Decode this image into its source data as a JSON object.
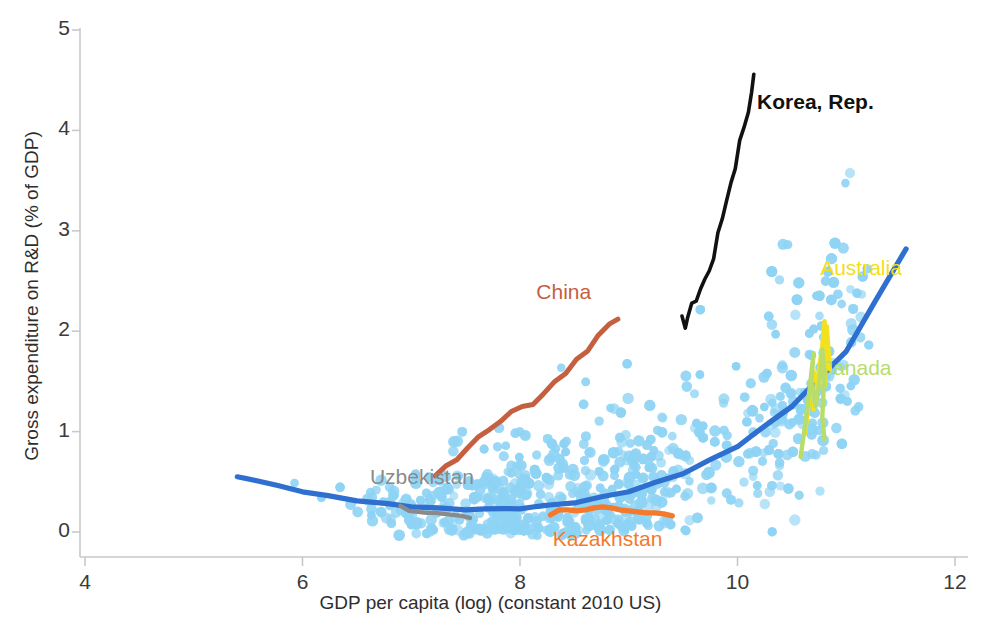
{
  "chart_data": {
    "type": "scatter",
    "title": "",
    "xlabel": "GDP per capita (log) (constant 2010 US)",
    "ylabel": "Gross expenditure on R&D (% of GDP)",
    "xlim": [
      3.6,
      12.3
    ],
    "ylim": [
      -0.25,
      5.0
    ],
    "xticks": [
      4,
      6,
      8,
      10,
      12
    ],
    "xtick_labels": [
      "4",
      "6",
      "8",
      "10",
      "12"
    ],
    "yticks": [
      0,
      1,
      2,
      3,
      4,
      5
    ],
    "ytick_labels": [
      "0",
      "1",
      "2",
      "3",
      "4",
      "5"
    ],
    "grid": false,
    "legend": "inline-annotations",
    "scatter": {
      "name": "All countries (pooled years)",
      "color": "#8ed3f4",
      "marker": "circle",
      "point_count": 1100,
      "description": "Pooled country-year observations of R&D intensity vs log GDP per capita; density increases with GDP, spread widens above log GDP 10."
    },
    "trend": {
      "name": "Quadratic fit",
      "color": "#2f6fd0",
      "x": [
        5.4,
        6.0,
        6.5,
        7.0,
        7.5,
        8.0,
        8.5,
        9.0,
        9.5,
        10.0,
        10.5,
        11.0,
        11.55
      ],
      "y": [
        0.55,
        0.4,
        0.31,
        0.25,
        0.22,
        0.23,
        0.29,
        0.4,
        0.58,
        0.85,
        1.25,
        1.8,
        2.82
      ]
    },
    "series": [
      {
        "name": "Korea, Rep.",
        "color": "#111111",
        "label_color": "#111111",
        "label_x": 10.18,
        "label_y": 4.25,
        "x": [
          9.49,
          9.52,
          9.54,
          9.58,
          9.62,
          9.66,
          9.7,
          9.74,
          9.78,
          9.82,
          9.86,
          9.9,
          9.94,
          9.98,
          10.02,
          10.06,
          10.1,
          10.13,
          10.15
        ],
        "y": [
          2.15,
          2.03,
          2.13,
          2.28,
          2.3,
          2.42,
          2.52,
          2.6,
          2.72,
          2.98,
          3.12,
          3.3,
          3.48,
          3.62,
          3.9,
          4.03,
          4.18,
          4.38,
          4.56
        ]
      },
      {
        "name": "China",
        "color": "#c4603f",
        "label_color": "#c4603f",
        "label_x": 8.15,
        "label_y": 2.36,
        "x": [
          7.22,
          7.32,
          7.42,
          7.52,
          7.62,
          7.72,
          7.82,
          7.92,
          8.02,
          8.12,
          8.22,
          8.32,
          8.42,
          8.52,
          8.62,
          8.72,
          8.82,
          8.9
        ],
        "y": [
          0.56,
          0.66,
          0.72,
          0.84,
          0.95,
          1.02,
          1.1,
          1.2,
          1.25,
          1.27,
          1.38,
          1.5,
          1.58,
          1.72,
          1.8,
          1.96,
          2.07,
          2.12
        ]
      },
      {
        "name": "Australia",
        "color": "#f3e11e",
        "label_color": "#f1df1a",
        "label_x": 10.76,
        "label_y": 2.6,
        "x": [
          10.62,
          10.66,
          10.7,
          10.73,
          10.7,
          10.74,
          10.78,
          10.8,
          10.82,
          10.8,
          10.78,
          10.82,
          10.85
        ],
        "y": [
          0.98,
          1.3,
          1.6,
          1.48,
          1.22,
          1.55,
          1.85,
          2.1,
          1.8,
          1.45,
          1.7,
          2.05,
          1.62
        ]
      },
      {
        "name": "Canada",
        "color": "#b8dd6a",
        "label_color": "#b8dd6a",
        "label_x": 10.74,
        "label_y": 1.6,
        "x": [
          10.58,
          10.62,
          10.66,
          10.7,
          10.68,
          10.72,
          10.76,
          10.78,
          10.8,
          10.78,
          10.8
        ],
        "y": [
          0.75,
          1.05,
          1.4,
          1.78,
          1.52,
          1.25,
          1.55,
          1.82,
          1.6,
          1.15,
          0.92
        ]
      },
      {
        "name": "Uzbekistan",
        "color": "#8a8a8a",
        "label_color": "#8a8a8a",
        "label_x": 6.62,
        "label_y": 0.52,
        "x": [
          6.9,
          6.98,
          7.06,
          7.14,
          7.22,
          7.3,
          7.38,
          7.46,
          7.54
        ],
        "y": [
          0.26,
          0.21,
          0.2,
          0.19,
          0.19,
          0.18,
          0.17,
          0.16,
          0.14
        ]
      },
      {
        "name": "Kazakhstan",
        "color": "#f4792a",
        "label_color": "#f4792a",
        "label_x": 8.3,
        "label_y": -0.1,
        "x": [
          8.28,
          8.36,
          8.44,
          8.52,
          8.6,
          8.68,
          8.76,
          8.84,
          8.92,
          9.0,
          9.08,
          9.16,
          9.24,
          9.32,
          9.4
        ],
        "y": [
          0.17,
          0.22,
          0.22,
          0.21,
          0.22,
          0.24,
          0.25,
          0.24,
          0.22,
          0.21,
          0.2,
          0.19,
          0.19,
          0.18,
          0.16
        ]
      }
    ]
  },
  "axes": {
    "x_title": "GDP per capita (log) (constant 2010 US)",
    "y_title": "Gross expenditure on R&D (% of GDP)",
    "x_tick_labels": [
      "4",
      "6",
      "8",
      "10",
      "12"
    ],
    "y_tick_labels": [
      "0",
      "1",
      "2",
      "3",
      "4",
      "5"
    ]
  },
  "labels": {
    "korea": "Korea, Rep.",
    "china": "China",
    "australia": "Australia",
    "canada": "Canada",
    "uzbekistan": "Uzbekistan",
    "kazakhstan": "Kazakhstan"
  },
  "colors": {
    "scatter": "#8ed3f4",
    "trend": "#2f6fd0",
    "korea": "#111111",
    "china": "#c4603f",
    "australia": "#f1df1a",
    "canada": "#b8dd6a",
    "uzbekistan": "#8a8a8a",
    "kazakhstan": "#f4792a",
    "axis": "#c9c9c9",
    "text": "#333333"
  }
}
